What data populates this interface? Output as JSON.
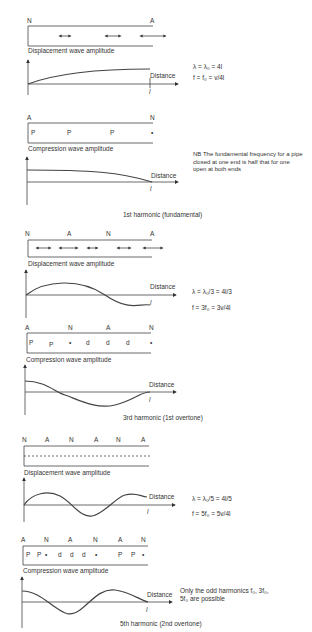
{
  "sections": [
    {
      "title": "1st harmonic (fundamental)",
      "displacement": {
        "nodes": [
          "N",
          "A"
        ],
        "label": "Displacement wave amplitude"
      },
      "compression": {
        "nodes": [
          "A",
          "N"
        ],
        "markers": [
          "P",
          "P",
          "P",
          "•"
        ],
        "label": "Compression wave amplitude"
      },
      "formula1": "λ = λ₀ = 4l",
      "formula2": "f = f₀ = v/4l",
      "axis_label": "Distance",
      "length_label": "l",
      "note": "NB  The fundamental frequency for a pipe closed at one end is half that for one open at both ends"
    },
    {
      "title": "3rd harmonic (1st overtone)",
      "displacement": {
        "nodes": [
          "N",
          "A",
          "N",
          "A"
        ],
        "label": "Displacement wave amplitude"
      },
      "compression": {
        "nodes": [
          "A",
          "N",
          "A",
          "N"
        ],
        "markers": [
          "P",
          "P",
          "•",
          "d",
          "d",
          "d",
          "•"
        ],
        "label": "Compression wave amplitude"
      },
      "formula1": "λ = λ₀/3 = 4l/3",
      "formula2": "f = 3f₀ = 3v/4l",
      "axis_label": "Distance",
      "length_label": "l"
    },
    {
      "title": "5th harmonic (2nd overtone)",
      "displacement": {
        "nodes": [
          "N",
          "A",
          "N",
          "A",
          "N",
          "A"
        ],
        "label": "Displacement wave amplitude"
      },
      "compression": {
        "nodes": [
          "A",
          "N",
          "A",
          "N",
          "A",
          "N"
        ],
        "markers": [
          "P",
          "P",
          "•",
          "d",
          "d",
          "d",
          "•",
          "P",
          "P",
          "•"
        ],
        "label": "Compression wave amplitude"
      },
      "formula1": "λ = λ₀/5 = 4l/5",
      "formula2": "f = 5f₀ = 5v/4l",
      "axis_label": "Distance",
      "length_label": "l",
      "note": "Only the odd harmonics f₀, 3f₀, 5f₀ are possible"
    }
  ]
}
